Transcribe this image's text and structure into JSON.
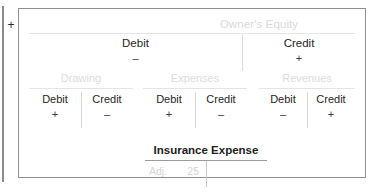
{
  "connector": {
    "symbol": "+"
  },
  "panel": {
    "equity": {
      "title": "Owner's Equity",
      "debit": {
        "label": "Debit",
        "sign": "–"
      },
      "credit": {
        "label": "Credit",
        "sign": "+"
      }
    },
    "groups": [
      {
        "name": "Drawing",
        "debit": {
          "label": "Debit",
          "sign": "+"
        },
        "credit": {
          "label": "Credit",
          "sign": "–"
        }
      },
      {
        "name": "Expenses",
        "debit": {
          "label": "Debit",
          "sign": "+"
        },
        "credit": {
          "label": "Credit",
          "sign": "–"
        }
      },
      {
        "name": "Revenues",
        "debit": {
          "label": "Debit",
          "sign": "–"
        },
        "credit": {
          "label": "Credit",
          "sign": "+"
        }
      }
    ],
    "t_account": {
      "title": "Insurance Expense",
      "debit_entry": {
        "label": "Adj.",
        "amount": "25"
      },
      "credit_entry": {
        "label": "",
        "amount": ""
      }
    }
  },
  "colors": {
    "panel_border": "#8f8f8f",
    "muted_text": "#d9d9d9",
    "primary_text": "#262626",
    "rule": "#e4e4e4"
  }
}
